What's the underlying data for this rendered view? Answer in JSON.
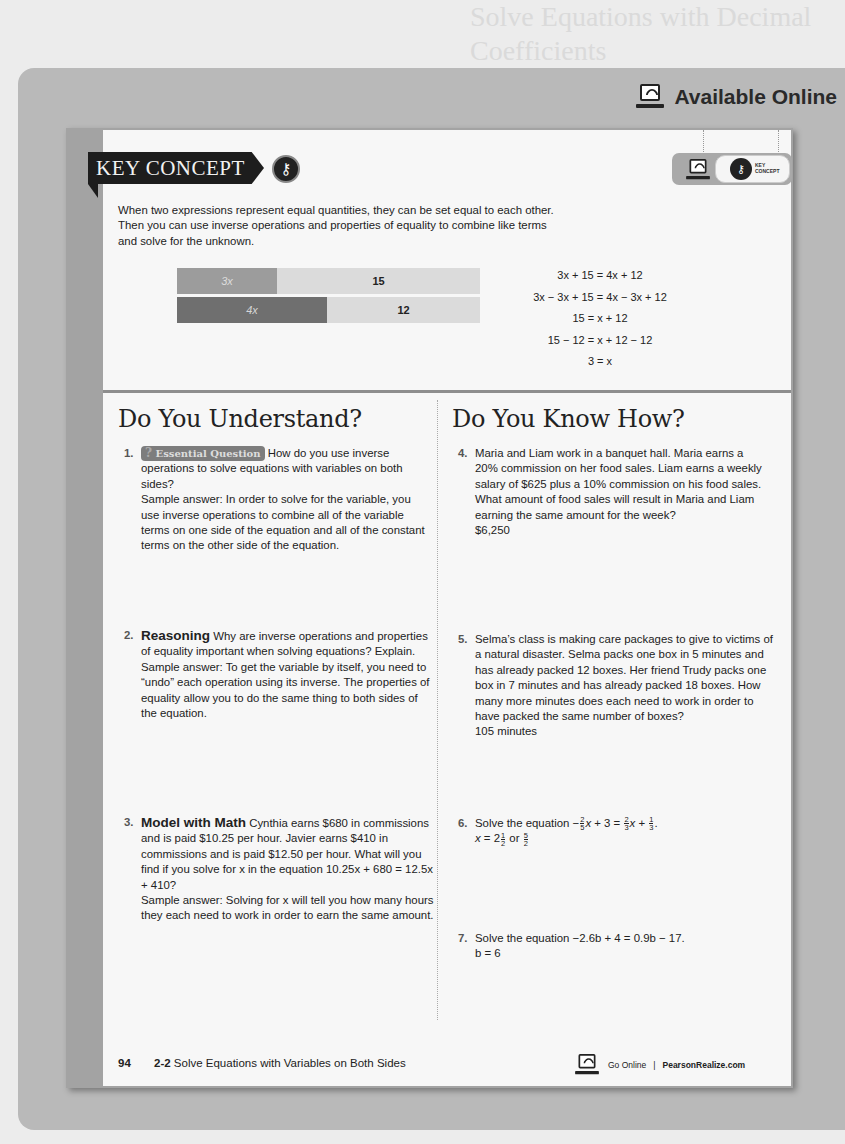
{
  "header": {
    "available_online": "Available Online",
    "ghost_text": "Solve Equations with Decimal Coefficients"
  },
  "key_concept": {
    "banner": "KEY CONCEPT",
    "key_icon": "key-icon",
    "pill_label_line1": "KEY",
    "pill_label_line2": "CONCEPT",
    "text": "When two expressions represent equal quantities, they can be set equal to each other. Then you can use inverse operations and properties of equality to combine like terms and solve for the unknown.",
    "bar_model": {
      "row1": [
        {
          "label": "3x",
          "value": "3x"
        },
        {
          "label": "15",
          "value": "15"
        }
      ],
      "row2": [
        {
          "label": "4x",
          "value": "4x"
        },
        {
          "label": "12",
          "value": "12"
        }
      ]
    },
    "equations": [
      "3x + 15 = 4x + 12",
      "3x − 3x + 15 = 4x − 3x + 12",
      "15 = x + 12",
      "15 − 12 = x + 12 − 12",
      "3 = x"
    ]
  },
  "understand": {
    "title": "Do You Understand?",
    "questions": [
      {
        "num": "1.",
        "badge": "Essential Question",
        "prompt": "How do you use inverse operations to solve equations with variables on both sides?",
        "answer": "Sample answer: In order to solve for the variable, you use inverse operations to combine all of the variable terms on one side of the equation and all of the constant terms on the other side of the equation."
      },
      {
        "num": "2.",
        "lead": "Reasoning",
        "prompt": "Why are inverse operations and properties of equality important when solving equations? Explain.",
        "answer": "Sample answer: To get the variable by itself, you need to “undo” each operation using its inverse. The properties of equality allow you to do the same thing to both sides of the equation."
      },
      {
        "num": "3.",
        "lead": "Model with Math",
        "prompt": "Cynthia earns $680 in commissions and is paid $10.25 per hour. Javier earns $410 in commissions and is paid $12.50 per hour. What will you find if you solve for x in the equation 10.25x + 680 = 12.5x + 410?",
        "answer": "Sample answer: Solving for x will tell you how many hours they each need to work in order to earn the same amount."
      }
    ]
  },
  "know_how": {
    "title": "Do You Know How?",
    "questions": [
      {
        "num": "4.",
        "prompt": "Maria and Liam work in a banquet hall. Maria earns a 20% commission on her food sales. Liam earns a weekly salary of $625 plus a 10% commission on his food sales. What amount of food sales will result in Maria and Liam earning the same amount for the week?",
        "answer": "$6,250"
      },
      {
        "num": "5.",
        "prompt": "Selma’s class is making care packages to give to victims of a natural disaster. Selma packs one box in 5 minutes and has already packed 12 boxes. Her friend Trudy packs one box in 7 minutes and has already packed 18 boxes. How many more minutes does each need to work in order to have packed the same number of boxes?",
        "answer": "105 minutes"
      },
      {
        "num": "6.",
        "prompt_prefix": "Solve the equation",
        "equation": "−2/5x + 3 = 2/3x + 1/3.",
        "answer": "x = 2 1/2 or 5/2"
      },
      {
        "num": "7.",
        "prompt": "Solve the equation −2.6b + 4 = 0.9b − 17.",
        "answer": "b = 6"
      }
    ]
  },
  "footer": {
    "page_number": "94",
    "lesson_number": "2-2",
    "lesson_title": "Solve Equations with Variables on Both Sides",
    "go_online": "Go Online",
    "separator": "|",
    "site": "PearsonRealize.com"
  }
}
